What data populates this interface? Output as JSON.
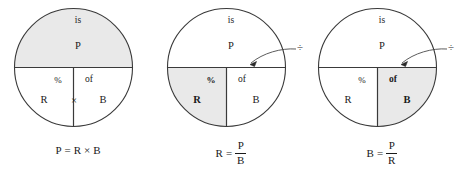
{
  "diagram": {
    "shade_color": "#e9e9e9",
    "line_color": "#3a3a3a",
    "text_color": "#1a1a1a",
    "units": [
      {
        "id": "unit-multiply",
        "labels": {
          "top_small": "is",
          "top_main": "P",
          "left_small": "%",
          "right_small": "of",
          "left_main": "R",
          "right_main": "B",
          "center_operator": "×"
        },
        "operator_callout": "",
        "shaded_region": "top-half",
        "formula": {
          "text": "P = R × B",
          "left": "P",
          "equals": "=",
          "type": "product",
          "factor1": "R",
          "operator": "×",
          "factor2": "B"
        }
      },
      {
        "id": "unit-divide-rate",
        "labels": {
          "top_small": "is",
          "top_main": "P",
          "left_small": "%",
          "right_small": "of",
          "left_main": "R",
          "right_main": "B",
          "center_operator": ""
        },
        "operator_callout": "÷",
        "shaded_region": "bottom-left-quarter",
        "formula": {
          "text": "R = P/B",
          "left": "R",
          "equals": "=",
          "type": "fraction",
          "numerator": "P",
          "denominator": "B"
        }
      },
      {
        "id": "unit-divide-base",
        "labels": {
          "top_small": "is",
          "top_main": "P",
          "left_small": "%",
          "right_small": "of",
          "left_main": "R",
          "right_main": "B",
          "center_operator": ""
        },
        "operator_callout": "÷",
        "shaded_region": "bottom-right-quarter",
        "formula": {
          "text": "B = P/R",
          "left": "B",
          "equals": "=",
          "type": "fraction",
          "numerator": "P",
          "denominator": "R"
        }
      }
    ]
  }
}
